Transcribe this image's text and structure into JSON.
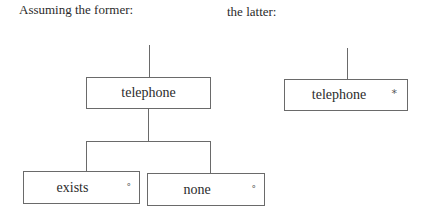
{
  "captions": {
    "left": "Assuming the former:",
    "right": "the latter:"
  },
  "left_tree": {
    "root": {
      "label": "telephone",
      "marker": ""
    },
    "children": [
      {
        "label": "exists",
        "marker": "°"
      },
      {
        "label": "none",
        "marker": "°"
      }
    ]
  },
  "right_tree": {
    "root": {
      "label": "telephone",
      "marker": "*"
    }
  }
}
